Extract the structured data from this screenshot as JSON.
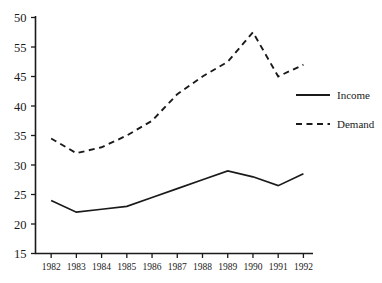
{
  "chart_data": {
    "type": "line",
    "title": "",
    "xlabel": "",
    "ylabel": "",
    "categories": [
      "1982",
      "1983",
      "1984",
      "1985",
      "1986",
      "1987",
      "1988",
      "1989",
      "1990",
      "1991",
      "1992"
    ],
    "series": [
      {
        "name": "Income",
        "style": "solid",
        "color": "#1a1a1a",
        "values": [
          24,
          22,
          22.5,
          23,
          24.5,
          26,
          27.5,
          29,
          28,
          26.5,
          28.5
        ]
      },
      {
        "name": "Demand",
        "style": "dashed",
        "color": "#1a1a1a",
        "values": [
          34.5,
          32,
          33,
          35,
          37.5,
          42,
          45,
          47.5,
          52.5,
          45,
          47
        ]
      }
    ],
    "ylim": [
      15,
      55
    ],
    "ytick_values": [
      55,
      50,
      45,
      40,
      35,
      30,
      25,
      20,
      15
    ],
    "ytick_labels": [
      "50",
      "55",
      "45",
      "40",
      "35",
      "30",
      "25",
      "20",
      "15"
    ],
    "grid": false,
    "legend_position": "right"
  },
  "legend": {
    "entries": [
      {
        "label": "Income",
        "style": "solid"
      },
      {
        "label": "Demand",
        "style": "dashed"
      }
    ]
  },
  "colors": {
    "ink": "#1a1a1a",
    "background": "#ffffff"
  }
}
